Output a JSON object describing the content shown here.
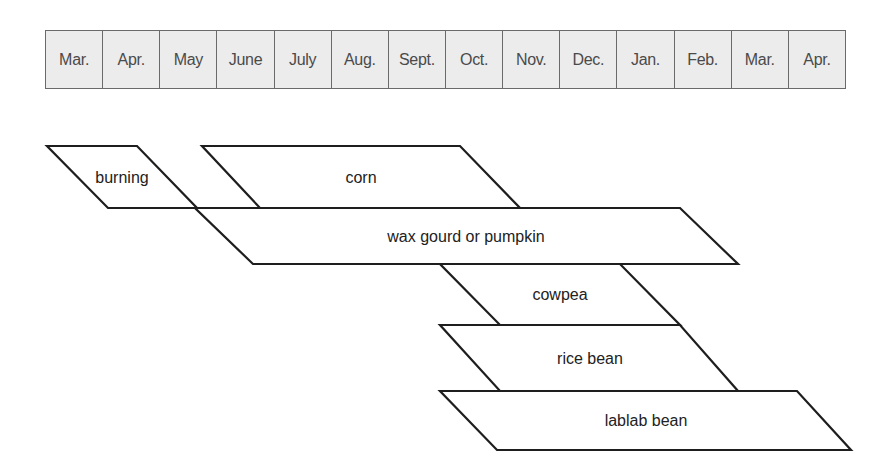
{
  "calendar": {
    "months": [
      "Mar.",
      "Apr.",
      "May",
      "June",
      "July",
      "Aug.",
      "Sept.",
      "Oct.",
      "Nov.",
      "Dec.",
      "Jan.",
      "Feb.",
      "Mar.",
      "Apr."
    ]
  },
  "phases": [
    {
      "id": "burning",
      "label": "burning"
    },
    {
      "id": "corn",
      "label": "corn"
    },
    {
      "id": "wax-gourd",
      "label": "wax gourd or pumpkin"
    },
    {
      "id": "cowpea",
      "label": "cowpea"
    },
    {
      "id": "rice-bean",
      "label": "rice bean"
    },
    {
      "id": "lablab-bean",
      "label": "lablab bean"
    }
  ],
  "colors": {
    "header_fill": "#ececec",
    "header_border": "#6a6a6a",
    "shape_stroke": "#1e1e1e",
    "text": "#222222"
  }
}
